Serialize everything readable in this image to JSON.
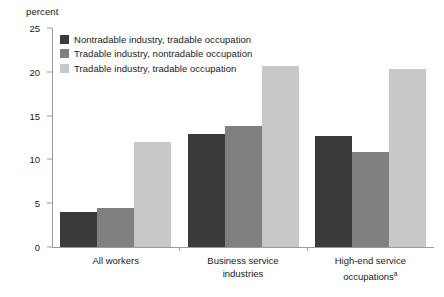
{
  "chart_data": {
    "type": "bar",
    "title": "",
    "xlabel": "",
    "ylabel": "percent",
    "ylim": [
      0,
      25
    ],
    "yticks": [
      0,
      5,
      10,
      15,
      20,
      25
    ],
    "grid": false,
    "legend_position": "top-left",
    "categories": [
      "All workers",
      "Business service industries",
      "High-end service occupations"
    ],
    "category_footnote_markers": [
      "",
      "",
      "a"
    ],
    "series": [
      {
        "name": "Nontradable industry, tradable occupation",
        "color": "#3a3a3a",
        "values": [
          4.0,
          12.9,
          12.7
        ]
      },
      {
        "name": "Tradable industry, nontradable occupation",
        "color": "#808080",
        "values": [
          4.4,
          13.8,
          10.9
        ]
      },
      {
        "name": "Tradable industry, tradable occupation",
        "color": "#c8c8c8",
        "values": [
          12.0,
          20.7,
          20.3
        ]
      }
    ]
  },
  "axis": {
    "unit_label": "percent"
  },
  "category_labels": [
    {
      "line1": "All workers",
      "line2": "",
      "marker": ""
    },
    {
      "line1": "Business service",
      "line2": "industries",
      "marker": ""
    },
    {
      "line1": "High-end service",
      "line2": "occupations",
      "marker": "a"
    }
  ]
}
